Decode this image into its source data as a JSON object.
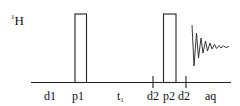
{
  "diagram": {
    "nucleus": {
      "mass": "1",
      "symbol": "H"
    },
    "pulses": [
      {
        "name": "p1",
        "x": 75,
        "width": 11.5,
        "top": 14
      },
      {
        "name": "p2",
        "x": 163.5,
        "width": 12.5,
        "top": 14
      }
    ],
    "ticks": [
      {
        "x": 153
      },
      {
        "x": 186
      }
    ],
    "labels": [
      {
        "id": "d1",
        "text": "d1",
        "x": 44
      },
      {
        "id": "p1",
        "text": "p1",
        "x": 72
      },
      {
        "id": "t1",
        "text": "t",
        "sub": "1",
        "x": 117
      },
      {
        "id": "d2a",
        "text": "d2",
        "x": 147
      },
      {
        "id": "p2",
        "text": "p2",
        "x": 163
      },
      {
        "id": "d2b",
        "text": "d2",
        "x": 178
      },
      {
        "id": "aq",
        "text": "aq",
        "x": 205
      }
    ],
    "acquisition": "FID"
  }
}
